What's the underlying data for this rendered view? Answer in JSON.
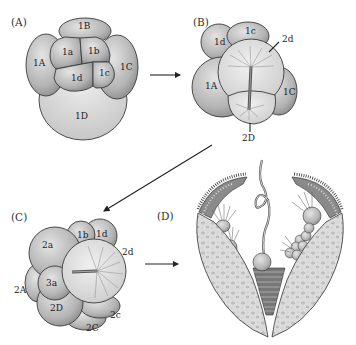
{
  "figure": {
    "panels": [
      {
        "id": "A",
        "label": "(A)",
        "cells": [
          "1B",
          "1a",
          "1b",
          "1A",
          "1C",
          "1d",
          "1c",
          "1D"
        ]
      },
      {
        "id": "B",
        "label": "(B)",
        "cells": [
          "1d",
          "1c",
          "2d",
          "1A",
          "1C",
          "2D"
        ]
      },
      {
        "id": "C",
        "label": "(C)",
        "cells": [
          "1b",
          "1d",
          "2a",
          "2d",
          "3a",
          "2A",
          "2D",
          "2c",
          "2C"
        ]
      },
      {
        "id": "D",
        "label": "(D)",
        "description": "Larva with ciliated bands, apical tuft and striated stomodeum"
      }
    ],
    "arrows": [
      {
        "from": "A",
        "to": "B"
      },
      {
        "from": "B",
        "to": "C"
      },
      {
        "from": "C",
        "to": "D"
      }
    ],
    "colors": {
      "cell_fill_light": "#d8d8d8",
      "cell_fill_dark": "#9a9a9a",
      "outline": "#3a3a3a",
      "background": "#ffffff"
    }
  }
}
